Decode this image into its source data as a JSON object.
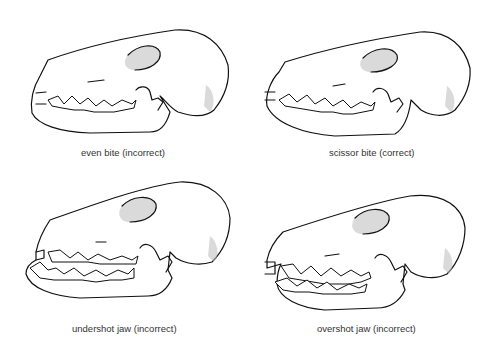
{
  "figure": {
    "panels": [
      {
        "id": "even-bite",
        "caption": "even bite (incorrect)",
        "bite_type": "even bite",
        "assessment": "incorrect"
      },
      {
        "id": "scissor-bite",
        "caption": "scissor bite (correct)",
        "bite_type": "scissor bite",
        "assessment": "correct"
      },
      {
        "id": "undershot-jaw",
        "caption": "undershot jaw (incorrect)",
        "bite_type": "undershot jaw",
        "assessment": "incorrect"
      },
      {
        "id": "overshot-jaw",
        "caption": "overshot jaw (incorrect)",
        "bite_type": "overshot jaw",
        "assessment": "incorrect"
      }
    ],
    "colors": {
      "ink": "#111111",
      "background": "#ffffff",
      "caption": "#333333"
    }
  }
}
